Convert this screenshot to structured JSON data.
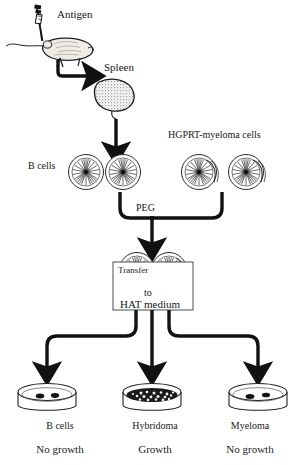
{
  "figure": {
    "background_color": "#ffffff",
    "ink_color": "#111111"
  },
  "steps": {
    "antigen_label": "Antigen",
    "spleen_label": "Spleen",
    "b_cells_label": "B cells",
    "myeloma_label": "HGPRT-myeloma cells",
    "fusion_agent_label": "PEG",
    "transfer_label": "Transfer",
    "to_label": "to",
    "medium_label": "HAT medium"
  },
  "dishes": [
    {
      "name": "B cells",
      "status": "No growth",
      "colonies": 2,
      "density": "sparse"
    },
    {
      "name": "Hybridoma",
      "status": "Growth",
      "colonies": 40,
      "density": "confluent"
    },
    {
      "name": "Myeloma",
      "status": "No growth",
      "colonies": 2,
      "density": "sparse"
    }
  ],
  "icons": {
    "syringe": "syringe-icon",
    "mouse": "mouse-icon",
    "spleen": "spleen-icon",
    "cell": "cell-icon",
    "petri_dish": "petri-dish-icon",
    "arrow": "arrow-icon"
  }
}
